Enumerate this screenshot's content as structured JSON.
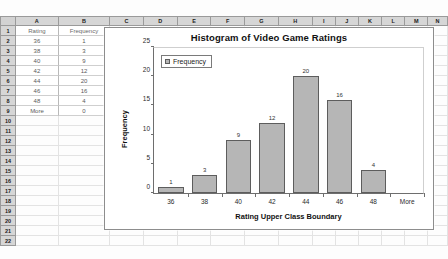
{
  "spreadsheet": {
    "column_headers": [
      "A",
      "B",
      "C",
      "D",
      "E",
      "F",
      "G",
      "H",
      "I",
      "J",
      "K",
      "L",
      "M",
      "N"
    ],
    "row_headers": [
      "1",
      "2",
      "3",
      "4",
      "5",
      "6",
      "7",
      "8",
      "9",
      "10",
      "11",
      "12",
      "13",
      "14",
      "15",
      "16",
      "17",
      "18",
      "19",
      "20",
      "21",
      "22"
    ],
    "table": {
      "headers": [
        "Rating",
        "Frequency"
      ],
      "rows": [
        {
          "rating": "36",
          "frequency": "1"
        },
        {
          "rating": "38",
          "frequency": "3"
        },
        {
          "rating": "40",
          "frequency": "9"
        },
        {
          "rating": "42",
          "frequency": "12"
        },
        {
          "rating": "44",
          "frequency": "20"
        },
        {
          "rating": "46",
          "frequency": "16"
        },
        {
          "rating": "48",
          "frequency": "4"
        },
        {
          "rating": "More",
          "frequency": "0"
        }
      ]
    }
  },
  "chart_data": {
    "type": "bar",
    "title": "Histogram of Video Game Ratings",
    "xlabel": "Rating Upper Class Boundary",
    "ylabel": "Frequency",
    "categories": [
      "36",
      "38",
      "40",
      "42",
      "44",
      "46",
      "48",
      "More"
    ],
    "values": [
      1,
      3,
      9,
      12,
      20,
      16,
      4,
      0
    ],
    "data_labels": [
      "1",
      "3",
      "9",
      "12",
      "20",
      "16",
      "4",
      ""
    ],
    "yticks": [
      "0",
      "5",
      "10",
      "15",
      "20",
      "25"
    ],
    "ylim": [
      0,
      25
    ],
    "grid": false,
    "legend": {
      "position": "top-left",
      "entries": [
        "Frequency"
      ]
    },
    "series_color": "#b6b6b6",
    "series_border_color": "#5d5d5d"
  }
}
